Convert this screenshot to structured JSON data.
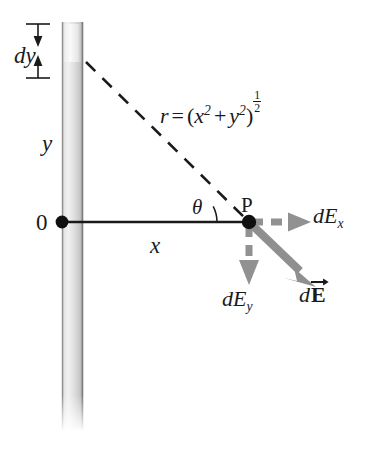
{
  "figure": {
    "background_color": "#ffffff",
    "ink_color": "#1a1a1a",
    "vector_color": "#8c8c8c",
    "rod_color": "#d4d4d4"
  },
  "labels": {
    "dy": "dy",
    "y": "y",
    "origin": "0",
    "x": "x",
    "theta": "θ",
    "point_p": "P",
    "r_lhs": "r",
    "r_equals": "=",
    "r_open": "(",
    "r_x": "x",
    "r_x_exp": "2",
    "r_plus": "+",
    "r_y": "y",
    "r_y_exp": "2",
    "r_close": ")",
    "r_pow_num": "1",
    "r_pow_den": "2",
    "dEx_d": "d",
    "dEx_E": "E",
    "dEx_sub": "x",
    "dEy_d": "d",
    "dEy_E": "E",
    "dEy_sub": "y",
    "dE_d": "d",
    "dE_E": "E"
  },
  "elements": {
    "rod": "charged-rod",
    "dy_segment": "charge-element-dy",
    "r_line": "distance-line-r",
    "x_axis": "horizontal-axis-x",
    "angle_arc": "angle-theta-arc",
    "p_dot": "point-p-marker",
    "origin_dot": "origin-marker",
    "dEx_arrow": "dEx-vector-arrow",
    "dEy_arrow": "dEy-vector-arrow",
    "dE_arrow": "dE-resultant-vector-arrow",
    "dy_top_arrow": "dy-top-arrow",
    "dy_bottom_arrow": "dy-bottom-arrow"
  },
  "geometry": {
    "origin_px": [
      62,
      222
    ],
    "point_p_px": [
      249,
      222
    ],
    "rod_top_px": 22,
    "rod_bottom_px": 430,
    "dy_top_px": 24,
    "dy_bottom_px": 62,
    "theta_degrees": 38
  }
}
